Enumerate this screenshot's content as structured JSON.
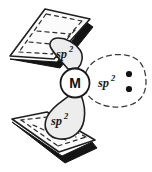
{
  "figure": {
    "background_color": "#ffffff",
    "line_color": "#1f1f1f",
    "lobe_fill_color": "#ededed",
    "plane_fill_color": "#fbfbfb",
    "plane_edge_shadow_color": "#141414",
    "metal_circle_fill": "#ffffff"
  },
  "metal_center": {
    "label": "M",
    "name": "metal-atom"
  },
  "orbitals": [
    {
      "id": "upper-left",
      "label_base": "sp",
      "label_sup": "2",
      "style": "solid",
      "points_to": "upper-ring-plane"
    },
    {
      "id": "lower-left",
      "label_base": "sp",
      "label_sup": "2",
      "style": "solid",
      "points_to": "lower-ring-plane"
    },
    {
      "id": "right-lone-pair",
      "label_base": "sp",
      "label_sup": "2",
      "style": "dashed",
      "points_to": "lone-pair"
    }
  ],
  "lone_pair": {
    "electron_count": 2,
    "dots": [
      "electron-dot",
      "electron-dot"
    ]
  },
  "ring_planes": [
    {
      "id": "upper-ring-plane",
      "position": "top-left",
      "interior_style": "dashed-ring"
    },
    {
      "id": "lower-ring-plane",
      "position": "bottom-left",
      "interior_style": "dashed-ring"
    }
  ]
}
